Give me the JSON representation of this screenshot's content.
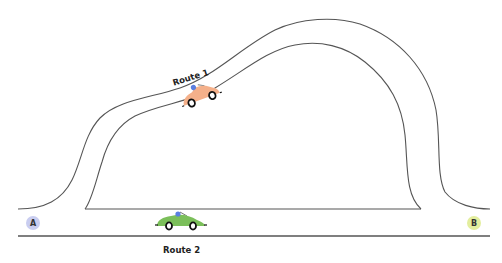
{
  "diagram": {
    "title": "",
    "routes": [
      {
        "id": "route-1",
        "label": "Route 1",
        "description": "long curving road over the hill",
        "car_color": "#f4b08a"
      },
      {
        "id": "route-2",
        "label": "Route 2",
        "description": "straight road along the bottom",
        "car_color": "#7bbf5a"
      }
    ],
    "points": [
      {
        "id": "A",
        "label": "A",
        "color": "#c9cdf0"
      },
      {
        "id": "B",
        "label": "B",
        "color": "#e3ee9e"
      }
    ],
    "colors": {
      "road_line": "#555555",
      "driver": "#5b7fe0",
      "wheel": "#111111"
    }
  }
}
